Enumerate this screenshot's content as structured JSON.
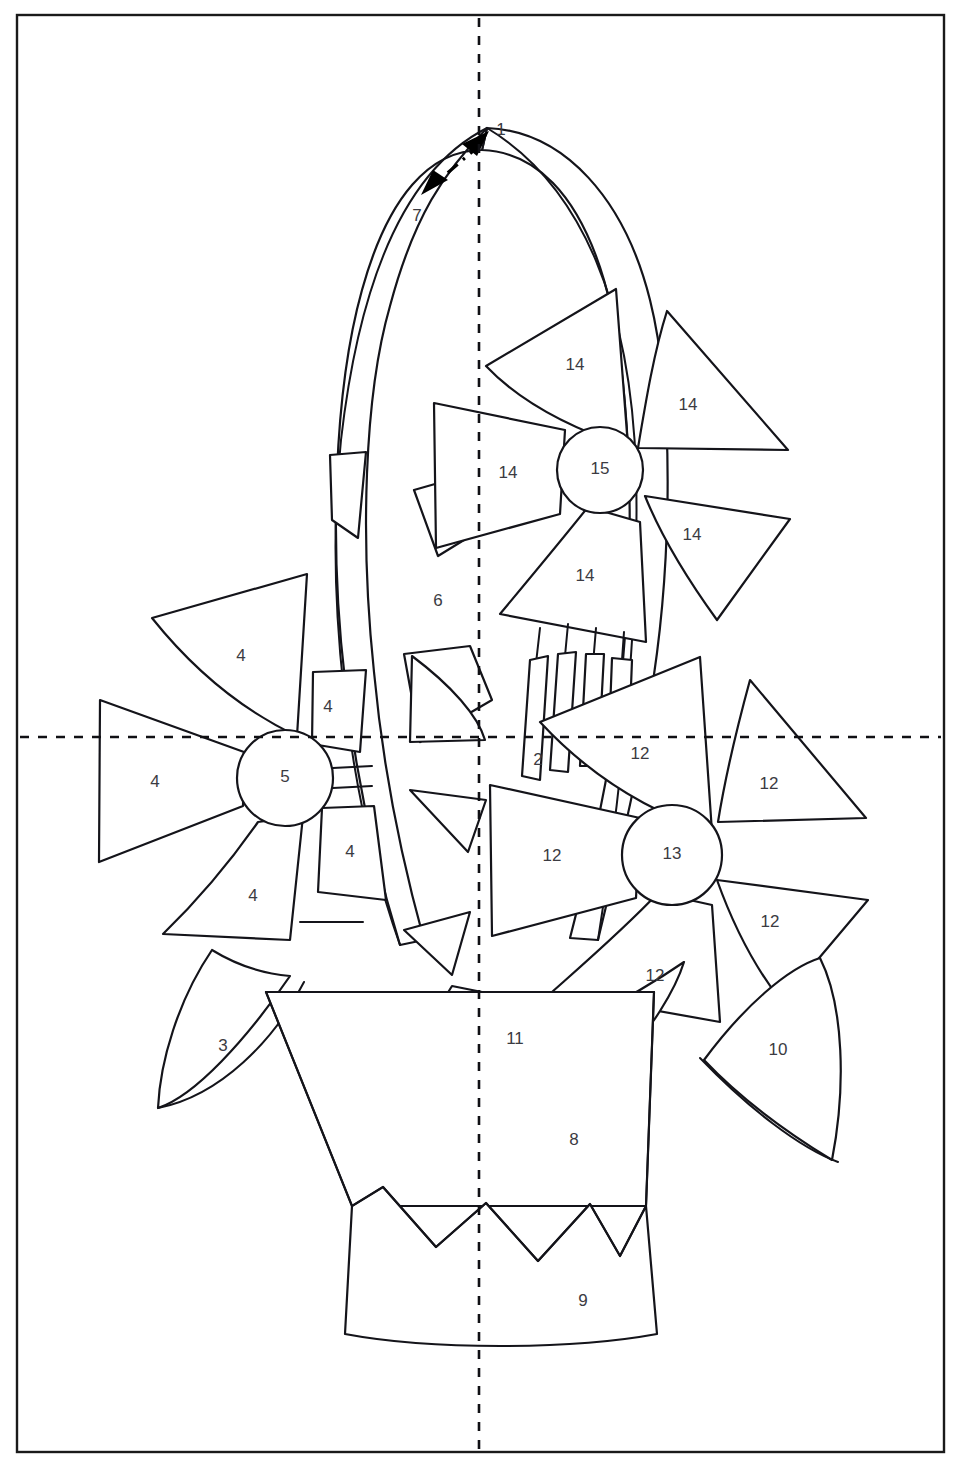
{
  "document": {
    "kind": "applique-pattern-sheet",
    "title": "Flower Basket Applique Pattern",
    "background_color": "#ffffff",
    "line_color": "#14141a",
    "label_color": "#3b3b42"
  },
  "page_border": {
    "x": 17,
    "y": 15,
    "width": 927,
    "height": 1437
  },
  "guides": {
    "vertical_center_x": 479,
    "horizontal_center_y": 737,
    "style": "dashed",
    "color": "#101014"
  },
  "placement_arrow": {
    "name": "handle-width-arrow",
    "style": "dash-dot double headed",
    "from_label": "7",
    "to_label": "1"
  },
  "labels": [
    {
      "id": "lbl-1",
      "text": "1",
      "x": 501,
      "y": 131,
      "part": "handle-outer-top"
    },
    {
      "id": "lbl-7",
      "text": "7",
      "x": 417,
      "y": 217,
      "part": "handle-inner-band"
    },
    {
      "id": "lbl-14a",
      "text": "14",
      "x": 575,
      "y": 366,
      "part": "top-flower-petal-upper-left"
    },
    {
      "id": "lbl-14b",
      "text": "14",
      "x": 688,
      "y": 406,
      "part": "top-flower-petal-upper-right"
    },
    {
      "id": "lbl-14c",
      "text": "14",
      "x": 508,
      "y": 474,
      "part": "top-flower-petal-left"
    },
    {
      "id": "lbl-15",
      "text": "15",
      "x": 600,
      "y": 470,
      "part": "top-flower-center"
    },
    {
      "id": "lbl-14d",
      "text": "14",
      "x": 692,
      "y": 536,
      "part": "top-flower-petal-right"
    },
    {
      "id": "lbl-14e",
      "text": "14",
      "x": 585,
      "y": 577,
      "part": "top-flower-petal-lower"
    },
    {
      "id": "lbl-6",
      "text": "6",
      "x": 438,
      "y": 602,
      "part": "handle-inner-fill"
    },
    {
      "id": "lbl-4a",
      "text": "4",
      "x": 241,
      "y": 657,
      "part": "left-flower-petal-upper"
    },
    {
      "id": "lbl-4b",
      "text": "4",
      "x": 328,
      "y": 708,
      "part": "left-flower-petal-upper-right"
    },
    {
      "id": "lbl-12a",
      "text": "12",
      "x": 640,
      "y": 755,
      "part": "right-flower-petal-upper"
    },
    {
      "id": "lbl-2",
      "text": "2",
      "x": 538,
      "y": 761,
      "part": "stem-band"
    },
    {
      "id": "lbl-4c",
      "text": "4",
      "x": 155,
      "y": 783,
      "part": "left-flower-petal-left"
    },
    {
      "id": "lbl-5",
      "text": "5",
      "x": 285,
      "y": 778,
      "part": "left-flower-center"
    },
    {
      "id": "lbl-12b",
      "text": "12",
      "x": 769,
      "y": 785,
      "part": "right-flower-petal-upper-right"
    },
    {
      "id": "lbl-12c",
      "text": "12",
      "x": 552,
      "y": 857,
      "part": "right-flower-petal-left"
    },
    {
      "id": "lbl-13",
      "text": "13",
      "x": 672,
      "y": 855,
      "part": "right-flower-center"
    },
    {
      "id": "lbl-4d",
      "text": "4",
      "x": 350,
      "y": 853,
      "part": "left-flower-petal-right"
    },
    {
      "id": "lbl-4e",
      "text": "4",
      "x": 253,
      "y": 897,
      "part": "left-flower-petal-lower"
    },
    {
      "id": "lbl-12d",
      "text": "12",
      "x": 770,
      "y": 923,
      "part": "right-flower-petal-right"
    },
    {
      "id": "lbl-12e",
      "text": "12",
      "x": 655,
      "y": 977,
      "part": "right-flower-petal-lower"
    },
    {
      "id": "lbl-11",
      "text": "11",
      "x": 515,
      "y": 1040,
      "part": "leaf-center-left"
    },
    {
      "id": "lbl-3",
      "text": "3",
      "x": 223,
      "y": 1047,
      "part": "leaf-left"
    },
    {
      "id": "lbl-10",
      "text": "10",
      "x": 778,
      "y": 1051,
      "part": "leaf-right"
    },
    {
      "id": "lbl-8",
      "text": "8",
      "x": 574,
      "y": 1141,
      "part": "leaf-center-right"
    },
    {
      "id": "lbl-9",
      "text": "9",
      "x": 583,
      "y": 1302,
      "part": "basket-band"
    }
  ],
  "piece_numbers_present": [
    1,
    2,
    3,
    4,
    5,
    6,
    7,
    8,
    9,
    10,
    11,
    12,
    13,
    14,
    15
  ]
}
